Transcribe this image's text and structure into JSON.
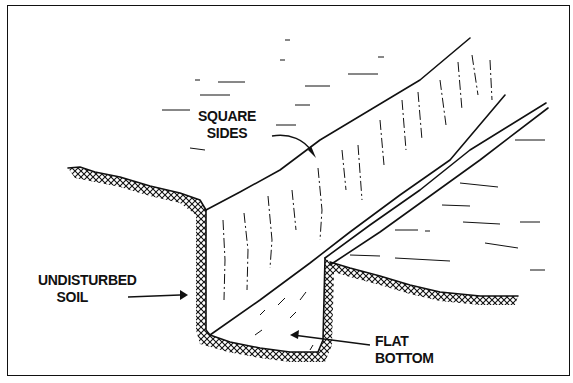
{
  "diagram": {
    "labels": {
      "square_sides": [
        "SQUARE",
        "SIDES"
      ],
      "undisturbed_soil": [
        "UNDISTURBED",
        "SOIL"
      ],
      "flat_bottom": [
        "FLAT",
        "BOTTOM"
      ]
    },
    "colors": {
      "ink": "#111111",
      "background": "#ffffff"
    }
  }
}
